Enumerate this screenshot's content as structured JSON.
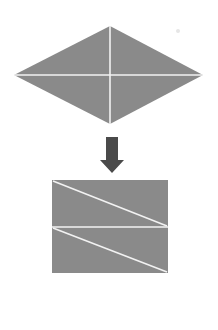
{
  "canvas": {
    "width": 218,
    "height": 330,
    "background_color": "#ffffff",
    "title": "Rhombus folded into rectangle"
  },
  "palette": {
    "shape_fill": "#8a8a8a",
    "fold_line": "#f2f2f2",
    "arrow_fill": "#4a4a4a",
    "background": "#ffffff",
    "speck": "#e6e6e6"
  },
  "shapes": {
    "rhombus": {
      "label": "rhombus",
      "fill": "#8a8a8a",
      "points": "110,26 203,75 110,124 14,75",
      "vertices": {
        "top": [
          110,
          26
        ],
        "right": [
          203,
          75
        ],
        "bottom": [
          110,
          124
        ],
        "left": [
          14,
          75
        ]
      },
      "fold_lines": [
        {
          "name": "vertical-diagonal",
          "x1": 110,
          "y1": 26,
          "x2": 110,
          "y2": 124
        },
        {
          "name": "horizontal-diagonal",
          "x1": 14,
          "y1": 75,
          "x2": 203,
          "y2": 75
        }
      ]
    },
    "arrow": {
      "label": "down-arrow",
      "direction": "down",
      "fill": "#4a4a4a",
      "points": "106,137 118,137 118,160 124,160 112,173 100,160 106,160",
      "bounds": {
        "x": 100,
        "y": 137,
        "width": 24,
        "height": 36
      }
    },
    "rectangle": {
      "label": "rectangle",
      "fill": "#8a8a8a",
      "x": 52,
      "y": 180,
      "width": 116,
      "height": 93,
      "fold_lines": [
        {
          "name": "horizontal-midline",
          "x1": 52,
          "y1": 227,
          "x2": 168,
          "y2": 227
        },
        {
          "name": "upper-diagonal",
          "x1": 53,
          "y1": 181,
          "x2": 167,
          "y2": 226
        },
        {
          "name": "lower-diagonal",
          "x1": 53,
          "y1": 228,
          "x2": 167,
          "y2": 272
        }
      ]
    },
    "speck": {
      "label": "speck-mark",
      "cx": 178,
      "cy": 31,
      "r": 2,
      "fill": "#e6e6e6"
    }
  }
}
